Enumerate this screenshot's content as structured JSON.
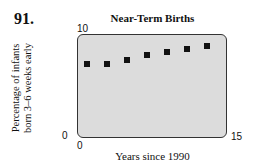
{
  "problem_number": "91.",
  "chart_data": {
    "type": "scatter",
    "title": "Near-Term Births",
    "xlabel": "Years since 1990",
    "ylabel": "Percentage of infants born 3–6 weeks early",
    "ylabel_lines": [
      "Percentage of infants",
      "born 3–6 weeks early"
    ],
    "xlim": [
      0,
      15
    ],
    "ylim": [
      0,
      10
    ],
    "x_ticks": [
      "0",
      "15"
    ],
    "y_ticks": [
      "0",
      "10"
    ],
    "grid": false,
    "x": [
      1,
      3,
      5,
      7,
      9,
      11,
      13
    ],
    "y": [
      7.1,
      7.1,
      7.5,
      7.9,
      8.2,
      8.5,
      8.8
    ],
    "marker": "square",
    "background": "#dcdcdc"
  }
}
